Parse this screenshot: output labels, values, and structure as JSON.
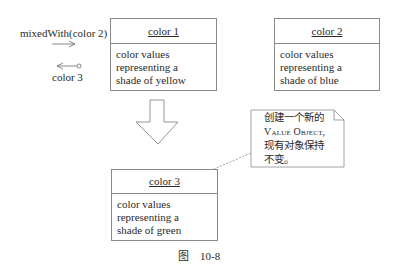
{
  "message": {
    "label": "mixedWith(color 2)",
    "return_label": "color 3"
  },
  "objects": [
    {
      "name": "color 1",
      "lines": [
        "color values",
        "representing a",
        "shade of yellow"
      ]
    },
    {
      "name": "color 2",
      "lines": [
        "color values",
        "representing a",
        "shade of blue"
      ]
    },
    {
      "name": "color 3",
      "lines": [
        "color values",
        "representing a",
        "shade of green"
      ]
    }
  ],
  "note": {
    "line1": "创建一个新的",
    "line2": "Value Object,",
    "line3": "现有对象保持",
    "line4": "不变。"
  },
  "caption": "图    10-8",
  "colors": {
    "stroke": "#8a8a8a",
    "text": "#2a2a2a"
  }
}
